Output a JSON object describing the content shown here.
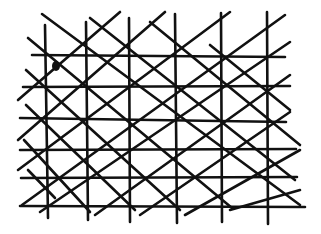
{
  "diagram": {
    "type": "hand-drawn lattice",
    "stroke_color": "#111111",
    "background": "#ffffff",
    "vertical_lines": [
      {
        "x1": 45,
        "y1": 25,
        "x2": 48,
        "y2": 218
      },
      {
        "x1": 86,
        "y1": 22,
        "x2": 88,
        "y2": 220
      },
      {
        "x1": 129,
        "y1": 18,
        "x2": 130,
        "y2": 222
      },
      {
        "x1": 175,
        "y1": 14,
        "x2": 177,
        "y2": 223
      },
      {
        "x1": 221,
        "y1": 13,
        "x2": 222,
        "y2": 222
      },
      {
        "x1": 267,
        "y1": 12,
        "x2": 268,
        "y2": 224
      }
    ],
    "horizontal_lines": [
      {
        "x1": 32,
        "y1": 55,
        "x2": 285,
        "y2": 57
      },
      {
        "x1": 23,
        "y1": 87,
        "x2": 290,
        "y2": 86
      },
      {
        "x1": 20,
        "y1": 118,
        "x2": 286,
        "y2": 122
      },
      {
        "x1": 20,
        "y1": 150,
        "x2": 296,
        "y2": 149
      },
      {
        "x1": 21,
        "y1": 178,
        "x2": 297,
        "y2": 177
      },
      {
        "x1": 20,
        "y1": 206,
        "x2": 305,
        "y2": 207
      }
    ],
    "diagonals_down": [
      {
        "x1": 42,
        "y1": 14,
        "x2": 300,
        "y2": 205
      },
      {
        "x1": 28,
        "y1": 38,
        "x2": 232,
        "y2": 208
      },
      {
        "x1": 26,
        "y1": 70,
        "x2": 180,
        "y2": 210
      },
      {
        "x1": 26,
        "y1": 105,
        "x2": 135,
        "y2": 210
      },
      {
        "x1": 24,
        "y1": 140,
        "x2": 90,
        "y2": 212
      },
      {
        "x1": 28,
        "y1": 170,
        "x2": 55,
        "y2": 198
      },
      {
        "x1": 90,
        "y1": 18,
        "x2": 295,
        "y2": 180
      },
      {
        "x1": 150,
        "y1": 22,
        "x2": 300,
        "y2": 145
      },
      {
        "x1": 210,
        "y1": 45,
        "x2": 290,
        "y2": 110
      }
    ],
    "diagonals_up": [
      {
        "x1": 18,
        "y1": 100,
        "x2": 120,
        "y2": 12
      },
      {
        "x1": 18,
        "y1": 140,
        "x2": 165,
        "y2": 12
      },
      {
        "x1": 18,
        "y1": 170,
        "x2": 230,
        "y2": 12
      },
      {
        "x1": 22,
        "y1": 205,
        "x2": 285,
        "y2": 15
      },
      {
        "x1": 40,
        "y1": 212,
        "x2": 290,
        "y2": 42
      },
      {
        "x1": 95,
        "y1": 215,
        "x2": 290,
        "y2": 75
      },
      {
        "x1": 140,
        "y1": 215,
        "x2": 290,
        "y2": 112
      },
      {
        "x1": 185,
        "y1": 215,
        "x2": 300,
        "y2": 150
      },
      {
        "x1": 230,
        "y1": 210,
        "x2": 300,
        "y2": 190
      }
    ],
    "marks": [
      {
        "type": "filled-blob",
        "cx": 56,
        "cy": 66,
        "rx": 4,
        "ry": 5
      }
    ]
  }
}
